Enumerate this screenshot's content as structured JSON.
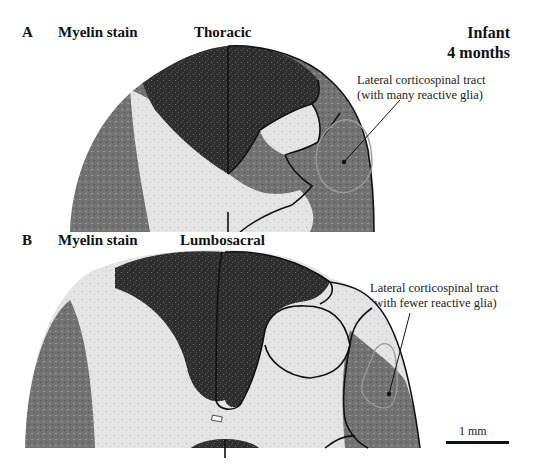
{
  "figure": {
    "panel_a": {
      "letter": "A",
      "stain": "Myelin stain",
      "level": "Thoracic",
      "annotation_line1": "Lateral corticospinal tract",
      "annotation_line2": "(with many reactive glia)"
    },
    "panel_b": {
      "letter": "B",
      "stain": "Myelin stain",
      "level": "Lumbosacral",
      "annotation_line1": "Lateral corticospinal tract",
      "annotation_line2": "(with fewer reactive glia)"
    },
    "subject": {
      "line1": "Infant",
      "line2": "4 months"
    },
    "scale_bar": {
      "label": "1 mm"
    },
    "colors": {
      "dark_white_matter": "#2b2b2b",
      "mid_white_matter": "#6e6e6e",
      "gray_matter": "#e6e6e6",
      "outline": "#111111",
      "tract_outline": "#9a9a9a"
    }
  }
}
